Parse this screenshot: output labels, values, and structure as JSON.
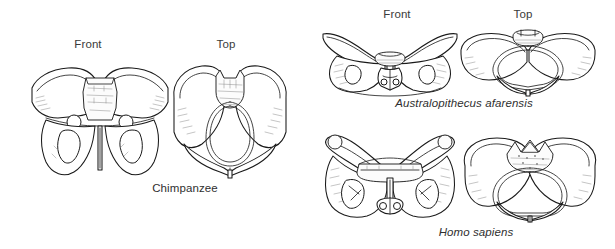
{
  "figure": {
    "background_color": "#ffffff",
    "line_color": "#1a1a1a",
    "text_color": "#2f2f2f"
  },
  "view_labels": {
    "front": "Front",
    "top": "Top"
  },
  "panels": [
    {
      "id": "chimpanzee",
      "species_label": "Chimpanzee",
      "italic": false,
      "views": [
        "Front",
        "Top"
      ],
      "front_view_label": "Front",
      "top_view_label": "Top"
    },
    {
      "id": "australopithecus-afarensis",
      "species_label": "Australopithecus afarensis",
      "italic": true,
      "views": [
        "Front",
        "Top"
      ],
      "front_view_label": "Front",
      "top_view_label": "Top"
    },
    {
      "id": "homo-sapiens",
      "species_label": "Homo sapiens",
      "italic": true,
      "views": [
        "Front",
        "Top"
      ],
      "front_view_label": "Front",
      "top_view_label": "Top"
    }
  ]
}
